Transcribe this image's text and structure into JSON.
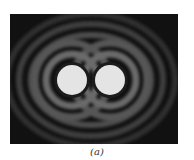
{
  "figure": {
    "caption": "(a)",
    "colors": {
      "background": "#111111",
      "disk": "#e6e6e6",
      "ring": "#6a6a6a"
    },
    "sources": [
      {
        "cx": 62,
        "cy": 66,
        "r": 15
      },
      {
        "cx": 100,
        "cy": 66,
        "r": 15
      }
    ]
  }
}
